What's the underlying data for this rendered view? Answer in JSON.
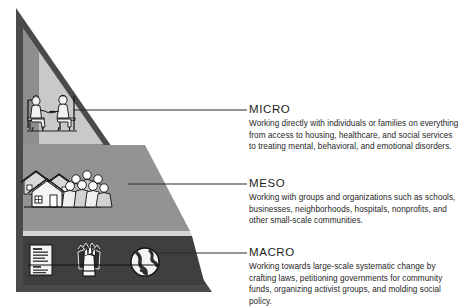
{
  "diagram": {
    "colors": {
      "background": "#ffffff",
      "outer_border": "#4a4a4a",
      "tier_top_inner": "#c9c9c9",
      "tier_top": "#8e8e8e",
      "tier_middle": "#939393",
      "tier_bottom": "#3f3f3f",
      "connector_line": "#2b2b2b",
      "heading_text": "#1c1c1c",
      "body_text": "#262626"
    },
    "levels": [
      {
        "id": "micro",
        "heading": "MICRO",
        "body": "Working directly with individuals or families on everything from access to housing, healthcare, and social services to treating mental, behavioral, and emotional disorders.",
        "icons": [
          "two-people-seated-counseling-icon"
        ]
      },
      {
        "id": "meso",
        "heading": "MESO",
        "body": "Working with groups and organizations such as schools, businesses, neighborhoods, hospitals, nonprofits, and other small-scale communities.",
        "icons": [
          "neighborhood-houses-icon",
          "group-of-people-icon"
        ]
      },
      {
        "id": "macro",
        "heading": "MACRO",
        "body": "Working towards large-scale systematic change by crafting laws, petitioning governments for community funds, organizing activist groups, and molding social policy.",
        "icons": [
          "legal-document-icon",
          "raised-fists-activism-icon",
          "globe-icon"
        ]
      }
    ]
  }
}
